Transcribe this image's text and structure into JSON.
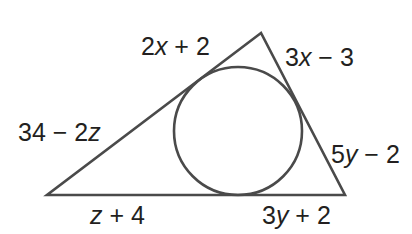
{
  "diagram": {
    "type": "inscribed-circle-triangle",
    "colors": {
      "background": "#ffffff",
      "stroke": "#4a4a4a",
      "text": "#231f20"
    },
    "triangle": {
      "vertices": {
        "top": [
          261,
          33
        ],
        "bottom_left": [
          47,
          195
        ],
        "bottom_right": [
          345,
          195
        ]
      }
    },
    "incircle": {
      "center": [
        238,
        131
      ],
      "radius": 64
    },
    "segment_labels": {
      "top_left_upper": {
        "coef": "2",
        "var": "x",
        "rest": " + 2",
        "full": "2x + 2"
      },
      "top_right_upper": {
        "coef": "3",
        "var": "x",
        "rest": " − 3",
        "full": "3x − 3"
      },
      "left_lower": {
        "coef": "34 − 2",
        "var": "z",
        "rest": "",
        "full": "34 − 2z"
      },
      "right_lower": {
        "coef": "5",
        "var": "y",
        "rest": " − 2",
        "full": "5y − 2"
      },
      "bottom_left": {
        "coef": "",
        "var": "z",
        "rest": " + 4",
        "full": "z + 4"
      },
      "bottom_right": {
        "coef": "3",
        "var": "y",
        "rest": " + 2",
        "full": "3y + 2"
      }
    }
  }
}
